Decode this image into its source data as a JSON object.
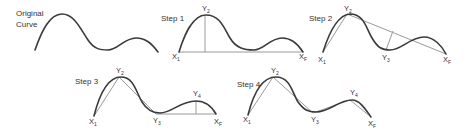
{
  "colors": {
    "curve": "#3a3a3a",
    "construction_lines": "#9a9a9a",
    "text": "#333333",
    "background": "#ffffff"
  },
  "panels": [
    {
      "id": "original",
      "label_line1": "Original",
      "label_line2": "Curve",
      "points": []
    },
    {
      "id": "step1",
      "label": "Step 1",
      "points": [
        {
          "name": "X",
          "sub": "1"
        },
        {
          "name": "Y",
          "sub": "2"
        },
        {
          "name": "X",
          "sub": "F"
        }
      ]
    },
    {
      "id": "step2",
      "label": "Step 2",
      "points": [
        {
          "name": "X",
          "sub": "1"
        },
        {
          "name": "Y",
          "sub": "2"
        },
        {
          "name": "Y",
          "sub": "3"
        },
        {
          "name": "X",
          "sub": "F"
        }
      ]
    },
    {
      "id": "step3",
      "label": "Step 3",
      "points": [
        {
          "name": "X",
          "sub": "1"
        },
        {
          "name": "Y",
          "sub": "2"
        },
        {
          "name": "Y",
          "sub": "3"
        },
        {
          "name": "Y",
          "sub": "4"
        },
        {
          "name": "X",
          "sub": "F"
        }
      ]
    },
    {
      "id": "step4",
      "label": "Step 4",
      "points": [
        {
          "name": "X",
          "sub": "1"
        },
        {
          "name": "Y",
          "sub": "2"
        },
        {
          "name": "Y",
          "sub": "3"
        },
        {
          "name": "Y",
          "sub": "4"
        },
        {
          "name": "X",
          "sub": "F"
        }
      ]
    }
  ]
}
